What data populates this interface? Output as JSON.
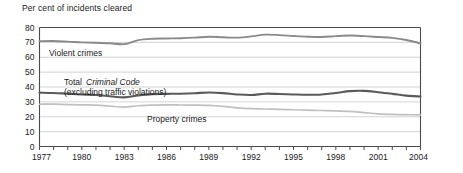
{
  "chart_data": {
    "type": "line",
    "title": "Per cent of incidents cleared",
    "xlabel": "",
    "ylabel": "",
    "ylim": [
      0,
      80
    ],
    "xlim": [
      1977,
      2004
    ],
    "ytick_step": 10,
    "grid": true,
    "legend": "inline-annotations",
    "yticks": [
      "0",
      "10",
      "20",
      "30",
      "40",
      "50",
      "60",
      "70",
      "80"
    ],
    "xticks_major": [
      "1977",
      "1980",
      "1983",
      "1986",
      "1989",
      "1992",
      "1995",
      "1998",
      "2001",
      "2004"
    ],
    "x": [
      1977,
      1978,
      1979,
      1980,
      1981,
      1982,
      1983,
      1984,
      1985,
      1986,
      1987,
      1988,
      1989,
      1990,
      1991,
      1992,
      1993,
      1994,
      1995,
      1996,
      1997,
      1998,
      1999,
      2000,
      2001,
      2002,
      2003,
      2004
    ],
    "series": [
      {
        "name": "Violent crimes",
        "color": "#8a8a8a",
        "values": [
          70.8,
          70.9,
          70.5,
          70.0,
          69.7,
          69.4,
          68.8,
          71.5,
          72.4,
          72.6,
          72.8,
          73.2,
          73.8,
          73.4,
          73.2,
          74.0,
          75.2,
          74.9,
          74.3,
          73.8,
          73.6,
          74.2,
          74.6,
          74.2,
          73.6,
          73.0,
          71.6,
          69.3
        ]
      },
      {
        "name": "Total Criminal Code (excluding traffic violations)",
        "color": "#5a5a5a",
        "values": [
          36.2,
          36.0,
          35.5,
          35.0,
          34.6,
          33.8,
          33.0,
          34.3,
          35.2,
          35.4,
          35.5,
          35.8,
          36.3,
          35.9,
          35.0,
          34.6,
          35.5,
          35.3,
          35.0,
          34.8,
          35.0,
          36.0,
          37.2,
          37.4,
          36.5,
          35.4,
          34.2,
          33.6
        ]
      },
      {
        "name": "Property crimes",
        "color": "#c0c0c0",
        "values": [
          28.4,
          28.5,
          28.2,
          28.0,
          27.8,
          27.2,
          26.5,
          27.4,
          27.8,
          28.0,
          27.9,
          27.8,
          27.6,
          27.0,
          26.0,
          25.4,
          25.2,
          25.0,
          24.7,
          24.4,
          24.2,
          24.0,
          23.6,
          22.8,
          22.0,
          21.6,
          21.4,
          21.3
        ]
      }
    ],
    "annotations": [
      {
        "name": "violent-crimes-label",
        "text": "Violent crimes",
        "x_px": 49,
        "y_px": 56
      },
      {
        "name": "total-criminal-code-label-line1-prefix",
        "text": "Total ",
        "x_px": 64,
        "y_px": 85
      },
      {
        "name": "total-criminal-code-label-line1-italic",
        "text": "Criminal Code",
        "x_px": 86,
        "y_px": 85
      },
      {
        "name": "total-criminal-code-label-line2",
        "text": "(excluding traffic violations)",
        "x_px": 64,
        "y_px": 95
      },
      {
        "name": "property-crimes-label",
        "text": "Property crimes",
        "x_px": 147,
        "y_px": 122
      }
    ]
  },
  "colors": {
    "background": "#ffffff",
    "text": "#1a1a1a",
    "gridline": "#c8c8c8",
    "frame": "#4a4a4a",
    "violent_crimes": "#8a8a8a",
    "total_criminal_code": "#5a5a5a",
    "property_crimes": "#c0c0c0"
  }
}
